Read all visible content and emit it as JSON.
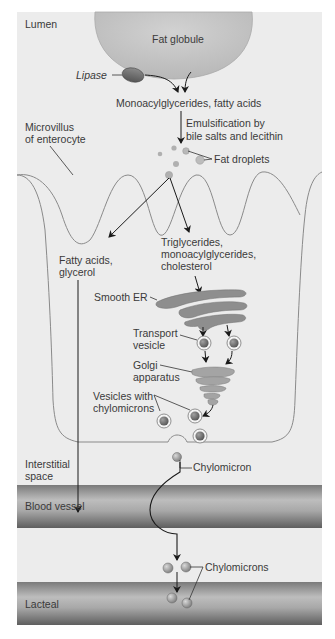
{
  "diagram": {
    "colors": {
      "background": "#ececec",
      "outer": "#ffffff",
      "globule": "#c6c6c6",
      "organelle": "#8e8e8e",
      "vessel_dark": "#6e6e6e",
      "vessel_light": "#bdbdbd",
      "arrow": "#1a1a1a",
      "text": "#3a3a3a"
    },
    "regions": {
      "lumen": "Lumen",
      "microvillus_line1": "Microvillus",
      "microvillus_line2": "of enterocyte",
      "interstitial_line1": "Interstitial",
      "interstitial_line2": "space",
      "blood_vessel": "Blood vessel",
      "lacteal": "Lacteal"
    },
    "labels": {
      "fat_globule": "Fat globule",
      "lipase": "Lipase",
      "mono_fatty": "Monoacylglycerides, fatty acids",
      "emulsification_line1": "Emulsification by",
      "emulsification_line2": "bile salts and lecithin",
      "fat_droplets": "Fat droplets",
      "fatty_acids_line1": "Fatty acids,",
      "fatty_acids_line2": "glycerol",
      "trig_line1": "Triglycerides,",
      "trig_line2": "monoacylglycerides,",
      "trig_line3": "cholesterol",
      "smooth_er": "Smooth ER",
      "transport_line1": "Transport",
      "transport_line2": "vesicle",
      "golgi_line1": "Golgi",
      "golgi_line2": "apparatus",
      "vesicles_line1": "Vesicles with",
      "vesicles_line2": "chylomicrons",
      "chylomicron": "Chylomicron",
      "chylomicrons": "Chylomicrons"
    }
  }
}
